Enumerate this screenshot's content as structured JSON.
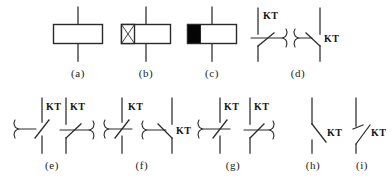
{
  "figure": {
    "label_text": "KT",
    "line_color": "#2a2a2a",
    "fill_black": "#050505",
    "fill_white": "#ffffff",
    "background": "#ffffff"
  },
  "rows": [
    {
      "row_id": "row-1",
      "items": [
        {
          "id": "a",
          "caption": "(a)",
          "name": "general-time-relay-coil",
          "description": "General time-relay coil: plain rectangle on a vertical conductor",
          "parts": [
            "vertical-conductor",
            "empty-rectangle"
          ],
          "labels": []
        },
        {
          "id": "b",
          "caption": "(b)",
          "name": "on-delay-relay-coil",
          "description": "Delay-on-energise coil: rectangle with cross-hatched square at left end",
          "parts": [
            "vertical-conductor",
            "rectangle",
            "cross-hatched-square"
          ],
          "labels": []
        },
        {
          "id": "c",
          "caption": "(c)",
          "name": "off-delay-relay-coil",
          "description": "Delay-on-de-energise coil: rectangle with solid black square at left end",
          "parts": [
            "vertical-conductor",
            "rectangle",
            "solid-black-square"
          ],
          "labels": []
        },
        {
          "id": "d",
          "caption": "(d)",
          "name": "on-delay-normally-open-contacts",
          "description": "Delay-on-make normally-open contacts, two drawing orientations",
          "parts": [
            "no-contact-right-chute",
            "no-contact-left-chute"
          ],
          "labels": [
            "KT",
            "KT"
          ]
        }
      ]
    },
    {
      "row_id": "row-2",
      "items": [
        {
          "id": "e",
          "caption": "(e)",
          "name": "on-delay-normally-closed-contacts",
          "description": "Delay-on-make normally-closed contact (left) and normally-open contact (right)",
          "parts": [
            "nc-contact-left-chute",
            "no-contact-right-chute"
          ],
          "labels": [
            "KT",
            "KT"
          ]
        },
        {
          "id": "f",
          "caption": "(f)",
          "name": "off-delay-contacts-pair-one",
          "description": "Delay-on-break normally-closed contact (left) and normally-open contact (right)",
          "parts": [
            "nc-contact-right-chute",
            "no-contact-left-chute"
          ],
          "labels": [
            "KT",
            "KT"
          ]
        },
        {
          "id": "g",
          "caption": "(g)",
          "name": "off-delay-contacts-pair-two",
          "description": "Delay-on-break normally-closed contact (left) and normally-open contact (right)",
          "parts": [
            "nc-contact-right-chute",
            "no-contact-right-chute"
          ],
          "labels": [
            "KT",
            "KT"
          ]
        },
        {
          "id": "h",
          "caption": "(h)",
          "name": "instantaneous-normally-closed-contact",
          "description": "Instantaneous normally-closed contact of the time relay",
          "parts": [
            "nc-contact-plain"
          ],
          "labels": [
            "KT"
          ]
        },
        {
          "id": "i",
          "caption": "(i)",
          "name": "instantaneous-normally-open-contact",
          "description": "Instantaneous normally-open contact of the time relay",
          "parts": [
            "no-contact-plain"
          ],
          "labels": [
            "KT"
          ]
        }
      ]
    }
  ]
}
